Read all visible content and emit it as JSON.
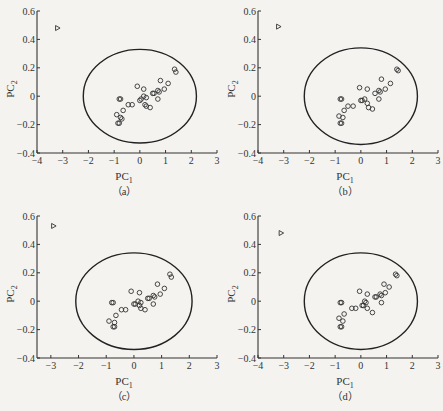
{
  "figure": {
    "panels": [
      {
        "id": "a",
        "caption": "（a）",
        "left": 0,
        "top": 0
      },
      {
        "id": "b",
        "caption": "（b）",
        "left": 221,
        "top": 0
      },
      {
        "id": "c",
        "caption": "（c）",
        "left": 0,
        "top": 205
      },
      {
        "id": "d",
        "caption": "（d）",
        "left": 221,
        "top": 205
      }
    ]
  },
  "chart_data": [
    {
      "panel": "a",
      "type": "scatter",
      "title": "",
      "caption": "(a)",
      "xlabel": "PC1",
      "ylabel": "PC2",
      "xlim": [
        -4,
        3
      ],
      "ylim": [
        -0.4,
        0.6
      ],
      "xticks": [
        -4,
        -3,
        -2,
        -1,
        0,
        1,
        2,
        3
      ],
      "yticks": [
        -0.4,
        -0.2,
        0,
        0.2,
        0.4,
        0.6
      ],
      "grid": false,
      "confidence_ellipse": {
        "cx": 0.0,
        "cy": 0.0,
        "rx": 2.2,
        "ry": 0.33
      },
      "outlier": {
        "marker": "triangle",
        "x": -3.2,
        "y": 0.48
      },
      "series": [
        {
          "name": "samples",
          "marker": "circle",
          "points": [
            [
              -0.8,
              -0.02
            ],
            [
              -0.75,
              -0.02
            ],
            [
              -0.9,
              -0.13
            ],
            [
              -0.85,
              -0.19
            ],
            [
              -0.8,
              -0.19
            ],
            [
              -0.75,
              -0.15
            ],
            [
              -0.7,
              -0.16
            ],
            [
              -0.65,
              -0.1
            ],
            [
              -0.45,
              -0.06
            ],
            [
              -0.3,
              -0.06
            ],
            [
              -0.1,
              0.07
            ],
            [
              0.0,
              -0.03
            ],
            [
              0.05,
              -0.02
            ],
            [
              0.15,
              0.0
            ],
            [
              0.2,
              -0.06
            ],
            [
              0.25,
              -0.01
            ],
            [
              0.25,
              -0.07
            ],
            [
              0.4,
              -0.08
            ],
            [
              0.15,
              0.05
            ],
            [
              0.5,
              0.02
            ],
            [
              0.55,
              0.02
            ],
            [
              0.7,
              0.04
            ],
            [
              0.75,
              0.03
            ],
            [
              0.7,
              -0.02
            ],
            [
              0.8,
              0.11
            ],
            [
              0.95,
              0.05
            ],
            [
              1.1,
              0.09
            ],
            [
              1.35,
              0.19
            ],
            [
              1.4,
              0.17
            ]
          ]
        }
      ]
    },
    {
      "panel": "b",
      "type": "scatter",
      "title": "",
      "caption": "(b)",
      "xlabel": "PC1",
      "ylabel": "PC2",
      "xlim": [
        -4,
        3
      ],
      "ylim": [
        -0.4,
        0.6
      ],
      "xticks": [
        -4,
        -3,
        -2,
        -1,
        0,
        1,
        2,
        3
      ],
      "yticks": [
        -0.4,
        -0.2,
        0,
        0.2,
        0.4,
        0.6
      ],
      "grid": false,
      "confidence_ellipse": {
        "cx": 0.0,
        "cy": 0.0,
        "rx": 2.2,
        "ry": 0.34
      },
      "outlier": {
        "marker": "triangle",
        "x": -3.2,
        "y": 0.49
      },
      "series": [
        {
          "name": "samples",
          "marker": "circle",
          "points": [
            [
              -0.8,
              -0.02
            ],
            [
              -0.75,
              -0.02
            ],
            [
              -0.85,
              -0.14
            ],
            [
              -0.8,
              -0.19
            ],
            [
              -0.75,
              -0.19
            ],
            [
              -0.7,
              -0.15
            ],
            [
              -0.65,
              -0.1
            ],
            [
              -0.5,
              -0.07
            ],
            [
              -0.3,
              -0.07
            ],
            [
              -0.05,
              0.06
            ],
            [
              0.0,
              -0.03
            ],
            [
              0.05,
              -0.03
            ],
            [
              0.15,
              -0.02
            ],
            [
              0.25,
              -0.05
            ],
            [
              0.3,
              -0.08
            ],
            [
              0.45,
              -0.09
            ],
            [
              0.25,
              0.05
            ],
            [
              0.55,
              0.02
            ],
            [
              0.7,
              0.04
            ],
            [
              0.75,
              0.03
            ],
            [
              0.7,
              -0.02
            ],
            [
              0.8,
              0.12
            ],
            [
              0.95,
              0.05
            ],
            [
              1.15,
              0.09
            ],
            [
              1.4,
              0.19
            ],
            [
              1.45,
              0.18
            ]
          ]
        }
      ]
    },
    {
      "panel": "c",
      "type": "scatter",
      "title": "",
      "caption": "(c)",
      "xlabel": "PC1",
      "ylabel": "PC2",
      "xlim": [
        -3.5,
        3
      ],
      "ylim": [
        -0.4,
        0.6
      ],
      "xticks": [
        -3,
        -2,
        -1,
        0,
        1,
        2,
        3
      ],
      "yticks": [
        -0.4,
        -0.2,
        0,
        0.2,
        0.4,
        0.6
      ],
      "grid": false,
      "confidence_ellipse": {
        "cx": 0.0,
        "cy": 0.0,
        "rx": 2.1,
        "ry": 0.34
      },
      "outlier": {
        "marker": "triangle",
        "x": -2.9,
        "y": 0.53
      },
      "series": [
        {
          "name": "samples",
          "marker": "circle",
          "points": [
            [
              -0.8,
              -0.01
            ],
            [
              -0.75,
              -0.01
            ],
            [
              -0.9,
              -0.14
            ],
            [
              -0.75,
              -0.18
            ],
            [
              -0.7,
              -0.18
            ],
            [
              -0.7,
              -0.15
            ],
            [
              -0.65,
              -0.1
            ],
            [
              -0.45,
              -0.06
            ],
            [
              -0.3,
              -0.06
            ],
            [
              -0.1,
              0.07
            ],
            [
              0.0,
              -0.02
            ],
            [
              0.05,
              -0.02
            ],
            [
              0.15,
              0.0
            ],
            [
              0.2,
              -0.03
            ],
            [
              0.25,
              -0.01
            ],
            [
              0.25,
              -0.05
            ],
            [
              0.4,
              -0.06
            ],
            [
              0.2,
              0.06
            ],
            [
              0.5,
              0.02
            ],
            [
              0.55,
              0.02
            ],
            [
              0.7,
              0.04
            ],
            [
              0.75,
              0.03
            ],
            [
              0.7,
              -0.02
            ],
            [
              0.85,
              0.12
            ],
            [
              0.95,
              0.05
            ],
            [
              1.1,
              0.09
            ],
            [
              1.3,
              0.19
            ],
            [
              1.35,
              0.17
            ]
          ]
        }
      ]
    },
    {
      "panel": "d",
      "type": "scatter",
      "title": "",
      "caption": "(d)",
      "xlabel": "PC1",
      "ylabel": "PC2",
      "xlim": [
        -4,
        3
      ],
      "ylim": [
        -0.4,
        0.6
      ],
      "xticks": [
        -4,
        -3,
        -2,
        -1,
        0,
        1,
        2,
        3
      ],
      "yticks": [
        -0.4,
        -0.2,
        0,
        0.2,
        0.4,
        0.6
      ],
      "grid": false,
      "confidence_ellipse": {
        "cx": 0.0,
        "cy": 0.0,
        "rx": 2.2,
        "ry": 0.34
      },
      "outlier": {
        "marker": "triangle",
        "x": -3.1,
        "y": 0.48
      },
      "series": [
        {
          "name": "samples",
          "marker": "circle",
          "points": [
            [
              -0.8,
              -0.01
            ],
            [
              -0.75,
              -0.01
            ],
            [
              -0.85,
              -0.12
            ],
            [
              -0.8,
              -0.18
            ],
            [
              -0.75,
              -0.18
            ],
            [
              -0.7,
              -0.14
            ],
            [
              -0.65,
              -0.09
            ],
            [
              -0.35,
              -0.05
            ],
            [
              -0.2,
              -0.05
            ],
            [
              -0.05,
              0.07
            ],
            [
              0.05,
              -0.03
            ],
            [
              0.1,
              -0.03
            ],
            [
              0.15,
              0.0
            ],
            [
              0.2,
              -0.01
            ],
            [
              0.25,
              -0.05
            ],
            [
              0.45,
              -0.08
            ],
            [
              0.25,
              0.05
            ],
            [
              0.55,
              0.03
            ],
            [
              0.6,
              0.03
            ],
            [
              0.75,
              0.05
            ],
            [
              0.8,
              0.04
            ],
            [
              0.8,
              -0.01
            ],
            [
              0.9,
              0.12
            ],
            [
              0.95,
              0.06
            ],
            [
              1.1,
              0.1
            ],
            [
              1.35,
              0.19
            ],
            [
              1.4,
              0.18
            ]
          ]
        }
      ]
    }
  ]
}
